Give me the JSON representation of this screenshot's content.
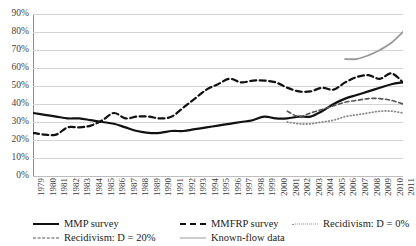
{
  "chart_data": {
    "type": "line",
    "title": "",
    "subtitle": "",
    "xlabel": "",
    "ylabel": "",
    "ylim": [
      0,
      90
    ],
    "ytick_labels": [
      "90%",
      "80%",
      "70%",
      "60%",
      "50%",
      "40%",
      "30%",
      "20%",
      "10%",
      "0%"
    ],
    "ytick_values": [
      90,
      80,
      70,
      60,
      50,
      40,
      30,
      20,
      10,
      0
    ],
    "grid": "horizontal",
    "legend_position": "bottom",
    "x": [
      1979,
      1980,
      1981,
      1982,
      1983,
      1984,
      1985,
      1986,
      1987,
      1988,
      1989,
      1990,
      1991,
      1992,
      1993,
      1994,
      1995,
      1996,
      1997,
      1998,
      1999,
      2000,
      2001,
      2002,
      2003,
      2004,
      2005,
      2006,
      2007,
      2008,
      2009,
      2010,
      2011
    ],
    "xtick_labels": [
      "1979",
      "1980",
      "1981",
      "1982",
      "1983",
      "1984",
      "1985",
      "1986",
      "1987",
      "1988",
      "1989",
      "1990",
      "1991",
      "1992",
      "1993",
      "1994",
      "1995",
      "1996",
      "1997",
      "1998",
      "1999",
      "2000",
      "2001",
      "2002",
      "2003",
      "2004",
      "2005",
      "2006",
      "2007",
      "2008",
      "2009",
      "2010",
      "2011"
    ],
    "series": [
      {
        "name": "MMP survey",
        "style": "solid",
        "color": "#111111",
        "width": 2.2,
        "x": [
          1979,
          1980,
          1981,
          1982,
          1983,
          1984,
          1985,
          1986,
          1987,
          1988,
          1989,
          1990,
          1991,
          1992,
          1993,
          1994,
          1995,
          1996,
          1997,
          1998,
          1999,
          2000,
          2001,
          2002,
          2003,
          2004,
          2005,
          2006,
          2007,
          2008,
          2009,
          2010,
          2011
        ],
        "values": [
          35,
          34,
          33,
          32,
          32,
          31,
          30,
          29,
          27,
          25,
          24,
          24,
          25,
          25,
          26,
          27,
          28,
          29,
          30,
          31,
          33,
          32,
          32,
          33,
          33,
          36,
          40,
          43,
          45,
          47,
          49,
          51,
          52
        ]
      },
      {
        "name": "MMFRP survey",
        "style": "dashed",
        "color": "#111111",
        "width": 2.2,
        "x": [
          1979,
          1980,
          1981,
          1982,
          1983,
          1984,
          1985,
          1986,
          1987,
          1988,
          1989,
          1990,
          1991,
          1992,
          1993,
          1994,
          1995,
          1996,
          1997,
          1998,
          1999,
          2000,
          2001,
          2002,
          2003,
          2004,
          2005,
          2006,
          2007,
          2008,
          2009,
          2010,
          2011
        ],
        "values": [
          24,
          23,
          23,
          27,
          27,
          28,
          31,
          35,
          32,
          33,
          33,
          32,
          33,
          38,
          43,
          48,
          51,
          54,
          52,
          53,
          53,
          52,
          49,
          47,
          47,
          49,
          48,
          52,
          55,
          56,
          54,
          57,
          52
        ]
      },
      {
        "name": "Recidivism: D = 20%",
        "style": "dashed",
        "color": "#555555",
        "width": 1.6,
        "x": [
          2001,
          2002,
          2003,
          2004,
          2005,
          2006,
          2007,
          2008,
          2009,
          2010,
          2011
        ],
        "values": [
          36,
          33,
          35,
          37,
          39,
          41,
          42,
          43,
          43,
          42,
          40
        ]
      },
      {
        "name": "Recidivism: D = 0%",
        "style": "dotted",
        "color": "#8a8a8a",
        "width": 1.8,
        "x": [
          2001,
          2002,
          2003,
          2004,
          2005,
          2006,
          2007,
          2008,
          2009,
          2010,
          2011
        ],
        "values": [
          30,
          29,
          29,
          30,
          31,
          33,
          34,
          35,
          36,
          36,
          35
        ]
      },
      {
        "name": "Known-flow data",
        "style": "solid",
        "color": "#9a9a9a",
        "width": 1.8,
        "x": [
          2006,
          2007,
          2008,
          2009,
          2010,
          2011
        ],
        "values": [
          65,
          65,
          67,
          70,
          74,
          80
        ]
      }
    ]
  },
  "legend": {
    "items": [
      {
        "label": "MMP survey",
        "swatch": "sw-solid-black"
      },
      {
        "label": "MMFRP survey",
        "swatch": "sw-dash-black"
      },
      {
        "label": "Recidivism: D = 0%",
        "swatch": "sw-dot-gray"
      },
      {
        "label": "Recidivism: D = 20%",
        "swatch": "sw-dash-gray"
      },
      {
        "label": "Known-flow data",
        "swatch": "sw-solid-gray"
      }
    ]
  }
}
